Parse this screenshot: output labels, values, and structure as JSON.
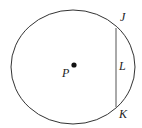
{
  "diagram": {
    "type": "circle-with-chord",
    "circle": {
      "cx": 73,
      "cy": 67,
      "rx": 62,
      "ry": 57,
      "stroke": "#333333"
    },
    "center": {
      "label": "P",
      "x": 74,
      "y": 65
    },
    "chord": {
      "x": 116,
      "y1": 28,
      "y2": 107,
      "stroke": "#555555"
    },
    "labels": {
      "center": "P",
      "top_endpoint": "J",
      "chord": "L",
      "bottom_endpoint": "K"
    }
  }
}
